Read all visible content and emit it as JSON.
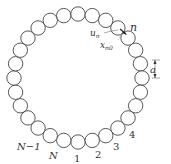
{
  "diagram": {
    "ring": {
      "cx": 78,
      "cy": 78,
      "r": 64,
      "count": 28,
      "atom_radius": 7.2
    },
    "colors": {
      "stroke": "#444444",
      "background": "#ffffff"
    },
    "labels": {
      "n": "n",
      "u_n": "u",
      "u_n_sub": "n",
      "x_n0": "x",
      "x_n0_sub": "n0",
      "a": "a",
      "N_minus_1": "N−1",
      "N": "N",
      "one": "1",
      "two": "2",
      "three": "3",
      "four": "4"
    }
  }
}
